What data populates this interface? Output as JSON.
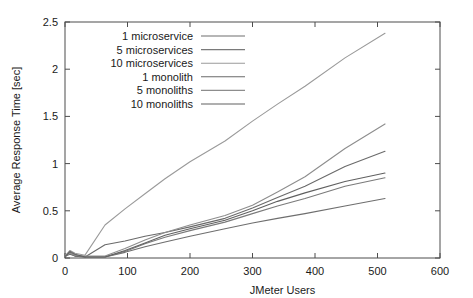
{
  "chart_data": {
    "type": "line",
    "title": "",
    "xlabel": "JMeter Users",
    "ylabel": "Average Response Time [sec]",
    "xlim": [
      0,
      600
    ],
    "ylim": [
      0,
      2.5
    ],
    "xticks": [
      0,
      100,
      200,
      300,
      400,
      500,
      600
    ],
    "xtick_labels": [
      "0",
      "100",
      "200",
      "300",
      "400",
      "500",
      "600"
    ],
    "yticks": [
      0,
      0.5,
      1,
      1.5,
      2,
      2.5
    ],
    "ytick_labels": [
      "0",
      "0.5",
      "1",
      "1.5",
      "2",
      "2.5"
    ],
    "grid": false,
    "legend_position": "top-left",
    "series": [
      {
        "name": "1 microservice",
        "color": "#6e6e6e",
        "x": [
          1,
          8,
          16,
          32,
          64,
          96,
          128,
          160,
          200,
          256,
          300,
          340,
          384,
          448,
          512
        ],
        "y": [
          0.02,
          0.06,
          0.03,
          0.01,
          0.01,
          0.06,
          0.12,
          0.17,
          0.23,
          0.31,
          0.37,
          0.42,
          0.47,
          0.55,
          0.63
        ]
      },
      {
        "name": "5 microservices",
        "color": "#7a7a7a",
        "x": [
          1,
          8,
          16,
          32,
          64,
          96,
          128,
          160,
          200,
          256,
          300,
          340,
          384,
          448,
          512
        ],
        "y": [
          0.02,
          0.05,
          0.02,
          0.01,
          0.01,
          0.07,
          0.15,
          0.22,
          0.29,
          0.38,
          0.47,
          0.55,
          0.63,
          0.76,
          0.85
        ]
      },
      {
        "name": "10 microservices",
        "color": "#9a9a9a",
        "x": [
          1,
          8,
          16,
          32,
          64,
          96,
          128,
          160,
          200,
          256,
          300,
          340,
          384,
          448,
          512
        ],
        "y": [
          0.03,
          0.08,
          0.05,
          0.03,
          0.35,
          0.52,
          0.68,
          0.84,
          1.02,
          1.24,
          1.45,
          1.63,
          1.82,
          2.12,
          2.38
        ]
      },
      {
        "name": "1 monolith",
        "color": "#6a6a6a",
        "x": [
          1,
          8,
          16,
          32,
          64,
          96,
          128,
          160,
          200,
          256,
          300,
          340,
          384,
          448,
          512
        ],
        "y": [
          0.02,
          0.04,
          0.02,
          0.01,
          0.14,
          0.18,
          0.23,
          0.27,
          0.33,
          0.42,
          0.53,
          0.64,
          0.76,
          0.97,
          1.13
        ]
      },
      {
        "name": "5 monoliths",
        "color": "#8d8d8d",
        "x": [
          1,
          8,
          16,
          32,
          64,
          96,
          128,
          160,
          200,
          256,
          300,
          340,
          384,
          448,
          512
        ],
        "y": [
          0.02,
          0.05,
          0.03,
          0.02,
          0.02,
          0.1,
          0.19,
          0.27,
          0.35,
          0.45,
          0.56,
          0.7,
          0.86,
          1.16,
          1.42
        ]
      },
      {
        "name": "10 monoliths",
        "color": "#606060",
        "x": [
          1,
          8,
          16,
          32,
          64,
          96,
          128,
          160,
          200,
          256,
          300,
          340,
          384,
          448,
          512
        ],
        "y": [
          0.02,
          0.07,
          0.04,
          0.01,
          0.01,
          0.08,
          0.16,
          0.24,
          0.31,
          0.4,
          0.5,
          0.6,
          0.69,
          0.81,
          0.9
        ]
      }
    ]
  }
}
